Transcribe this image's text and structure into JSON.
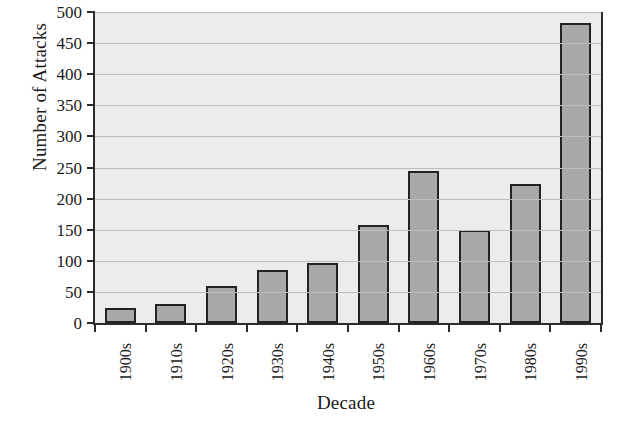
{
  "chart_data": {
    "type": "bar",
    "title": "",
    "xlabel": "Decade",
    "ylabel": "Number of Attacks",
    "categories": [
      "1900s",
      "1910s",
      "1920s",
      "1930s",
      "1940s",
      "1950s",
      "1960s",
      "1970s",
      "1980s",
      "1990s"
    ],
    "values": [
      24,
      31,
      60,
      85,
      97,
      157,
      245,
      150,
      223,
      483
    ],
    "ylim": [
      0,
      500
    ],
    "yticks": [
      0,
      50,
      100,
      150,
      200,
      250,
      300,
      350,
      400,
      450,
      500
    ],
    "ytick_labels": [
      "0",
      "50",
      "100",
      "150",
      "200",
      "250",
      "300",
      "350",
      "400",
      "450",
      "500"
    ],
    "grid": true,
    "legend": "none",
    "colors": {
      "bar_fill": "#a9a9a9",
      "bar_edge": "#232323",
      "plot_background": "#ececec",
      "gridline": "#bdbdbd",
      "axis": "#2b2b2b",
      "text": "#1a1a1a",
      "figure_background": "#ffffff"
    }
  }
}
